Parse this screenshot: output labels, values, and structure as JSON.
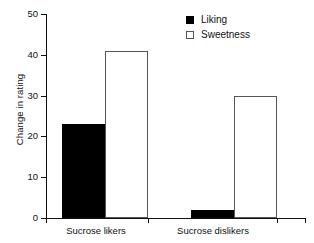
{
  "chart_data": {
    "type": "bar",
    "title": "",
    "xlabel": "",
    "ylabel": "Change in rating",
    "categories": [
      "Sucrose likers",
      "Sucrose dislikers"
    ],
    "series": [
      {
        "name": "Liking",
        "values": [
          23,
          2
        ],
        "style": "filled",
        "color": "#000000"
      },
      {
        "name": "Sweetness",
        "values": [
          41,
          30
        ],
        "style": "open",
        "color": "#ffffff"
      }
    ],
    "ylim": [
      0,
      50
    ],
    "yticks": [
      0,
      10,
      20,
      30,
      40,
      50
    ],
    "grid": false,
    "legend_position": "top-right"
  },
  "legend": {
    "entries": [
      {
        "label": "Liking",
        "marker": "filled-square"
      },
      {
        "label": "Sweetness",
        "marker": "open-square"
      }
    ]
  },
  "axes": {
    "y_label": "Change in rating",
    "y_tick_labels": [
      "50",
      "40",
      "30",
      "20",
      "10",
      "0"
    ],
    "x_tick_labels": [
      "Sucrose likers",
      "Sucrose dislikers"
    ]
  }
}
